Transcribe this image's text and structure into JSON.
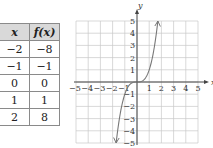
{
  "table": {
    "headers": [
      "x",
      "f(x)"
    ],
    "rows": [
      [
        "−2",
        "−8"
      ],
      [
        "−1",
        "−1"
      ],
      [
        "0",
        "0"
      ],
      [
        "1",
        "1"
      ],
      [
        "2",
        "8"
      ]
    ]
  },
  "chart_data": {
    "type": "line",
    "title": "",
    "function": "f(x) = x^3",
    "x": [
      -2,
      -1,
      0,
      1,
      2
    ],
    "values": [
      -8,
      -1,
      0,
      1,
      8
    ],
    "xlabel": "x",
    "ylabel": "y",
    "xlim": [
      -5,
      5
    ],
    "ylim": [
      -5,
      5
    ],
    "x_ticks": [
      "−5",
      "−4",
      "−3",
      "−2",
      "−1",
      "1",
      "2",
      "3",
      "4",
      "5"
    ],
    "y_ticks": [
      "5",
      "4",
      "3",
      "2",
      "1",
      "−1",
      "−2",
      "−3",
      "−4",
      "−5"
    ],
    "grid": true,
    "curve_color": "#777777"
  },
  "axes": {
    "x_label": "x",
    "y_label": "y"
  }
}
